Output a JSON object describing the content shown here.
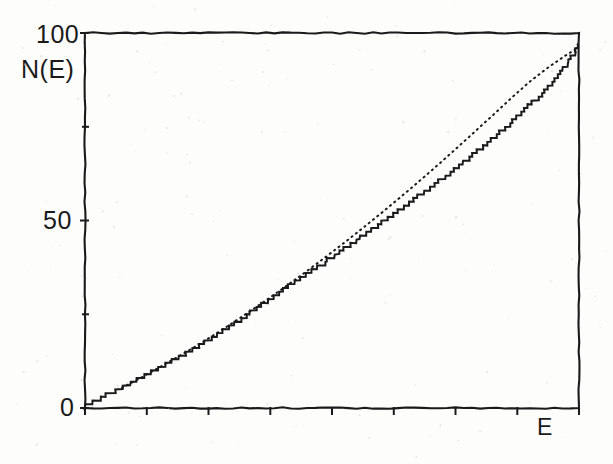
{
  "figure": {
    "title": "",
    "background_color": "#fdfdfc",
    "ink_color": "#1a1a1a"
  },
  "labels": {
    "y_axis_name": "N(E)",
    "x_axis_name": "E",
    "y_tick_100": "100",
    "y_tick_50": "50",
    "y_tick_0": "0"
  },
  "chart_data": {
    "type": "line",
    "title": "",
    "xlabel": "E",
    "ylabel": "N(E)",
    "xlim": [
      0,
      8
    ],
    "ylim": [
      0,
      100
    ],
    "grid": false,
    "legend_position": "none",
    "x_tick_labels": [
      "",
      "",
      "",
      "",
      "",
      "",
      "",
      "",
      ""
    ],
    "x_tick_values": [
      0,
      1,
      2,
      3,
      4,
      5,
      6,
      7,
      8
    ],
    "y_tick_labels": [
      "0",
      "",
      "50",
      "",
      "100"
    ],
    "y_tick_values": [
      0,
      25,
      50,
      75,
      100
    ],
    "y_major_ticks": [
      0,
      50,
      100
    ],
    "y_minor_ticks": [
      25,
      75
    ],
    "axis_box": "full-frame",
    "series": [
      {
        "name": "N(E) staircase",
        "style": "solid-step",
        "description": "integrated level counting function, unit steps",
        "x": [
          0.0,
          0.12,
          0.25,
          0.4,
          0.55,
          0.7,
          0.85,
          1.0,
          1.15,
          1.3,
          1.45,
          1.6,
          1.75,
          1.9,
          2.05,
          2.2,
          2.35,
          2.5,
          2.65,
          2.8,
          2.95,
          3.1,
          3.25,
          3.4,
          3.55,
          3.7,
          3.85,
          4.0,
          4.15,
          4.3,
          4.45,
          4.6,
          4.75,
          4.9,
          5.05,
          5.2,
          5.35,
          5.5,
          5.65,
          5.8,
          5.95,
          6.1,
          6.25,
          6.4,
          6.55,
          6.7,
          6.85,
          7.0,
          7.15,
          7.3,
          7.45,
          7.6,
          7.75,
          7.9,
          8.0
        ],
        "y": [
          0.5,
          1.4,
          2.6,
          3.9,
          5.0,
          6.4,
          7.6,
          9.0,
          10.3,
          11.6,
          13.0,
          14.3,
          15.6,
          17.1,
          18.6,
          20.3,
          21.9,
          23.4,
          25.0,
          26.8,
          28.5,
          30.2,
          31.7,
          33.5,
          35.2,
          36.8,
          38.3,
          40.2,
          42.0,
          43.7,
          45.4,
          47.1,
          48.8,
          50.3,
          52.2,
          54.0,
          55.8,
          57.6,
          59.3,
          61.2,
          63.0,
          65.0,
          67.0,
          69.0,
          71.0,
          73.0,
          75.2,
          77.5,
          79.8,
          82.2,
          84.6,
          87.5,
          90.5,
          94.0,
          97.0
        ]
      },
      {
        "name": "Weyl mean",
        "style": "dotted-smooth",
        "description": "smooth average counting function, convex",
        "x": [
          0.6,
          0.9,
          1.2,
          1.5,
          1.8,
          2.1,
          2.4,
          2.7,
          3.0,
          3.3,
          3.6,
          3.9,
          4.2,
          4.5,
          4.8,
          5.1,
          5.4,
          5.7,
          6.0,
          6.3,
          6.6,
          6.9,
          7.2,
          7.5,
          7.8,
          8.0
        ],
        "y": [
          5.4,
          8.0,
          10.8,
          13.6,
          16.5,
          19.6,
          22.8,
          26.1,
          29.5,
          33.0,
          36.6,
          40.3,
          44.1,
          48.0,
          52.0,
          56.1,
          60.3,
          64.6,
          69.0,
          73.5,
          78.0,
          82.6,
          87.0,
          90.8,
          94.2,
          96.2
        ]
      }
    ]
  }
}
